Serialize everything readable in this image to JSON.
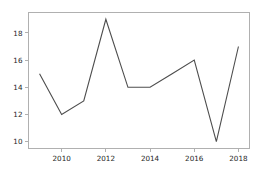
{
  "chart_data": {
    "type": "line",
    "title": "",
    "xlabel": "",
    "ylabel": "",
    "x": [
      2009,
      2010,
      2011,
      2012,
      2013,
      2014,
      2015,
      2016,
      2017,
      2018
    ],
    "values": [
      15,
      12,
      13,
      19,
      14,
      14,
      15,
      16,
      10,
      17
    ],
    "series": [
      {
        "name": "series-1",
        "values": [
          15,
          12,
          13,
          19,
          14,
          14,
          15,
          16,
          10,
          17
        ]
      }
    ],
    "xlim": [
      2008.5,
      2018.5
    ],
    "ylim": [
      9.5,
      19.5
    ],
    "xticks": [
      2010,
      2012,
      2014,
      2016,
      2018
    ],
    "yticks": [
      10,
      12,
      14,
      16,
      18
    ],
    "xtick_labels": [
      "2010",
      "2012",
      "2014",
      "2016",
      "2018"
    ],
    "ytick_labels": [
      "10",
      "12",
      "14",
      "16",
      "18"
    ],
    "grid": false,
    "legend": false,
    "legend_position": "none",
    "line_color": "#4d4d4d",
    "spine_color": "#b0b0b0",
    "tick_label_color": "#262626",
    "background_color": "#ffffff"
  },
  "axes": {
    "x_ticks": [
      {
        "label": "2010",
        "value": 2010
      },
      {
        "label": "2012",
        "value": 2012
      },
      {
        "label": "2014",
        "value": 2014
      },
      {
        "label": "2016",
        "value": 2016
      },
      {
        "label": "2018",
        "value": 2018
      }
    ],
    "y_ticks": [
      {
        "label": "10",
        "value": 10
      },
      {
        "label": "12",
        "value": 12
      },
      {
        "label": "14",
        "value": 14
      },
      {
        "label": "16",
        "value": 16
      },
      {
        "label": "18",
        "value": 18
      }
    ]
  }
}
